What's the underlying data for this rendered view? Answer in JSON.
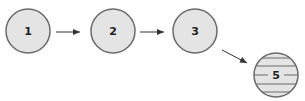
{
  "diagram": {
    "nodes": [
      {
        "id": "1",
        "label": "1",
        "style": "plain"
      },
      {
        "id": "2",
        "label": "2",
        "style": "plain"
      },
      {
        "id": "3",
        "label": "3",
        "style": "plain"
      },
      {
        "id": "5",
        "label": "5",
        "style": "striped"
      }
    ],
    "edges": [
      {
        "from": "1",
        "to": "2"
      },
      {
        "from": "2",
        "to": "3"
      },
      {
        "from": "3",
        "to": "5"
      }
    ],
    "colors": {
      "node_fill": "#e4e4e4",
      "node_stroke": "#6b6b6b",
      "stripe": "#6b6b6b",
      "arrow": "#333333"
    }
  }
}
